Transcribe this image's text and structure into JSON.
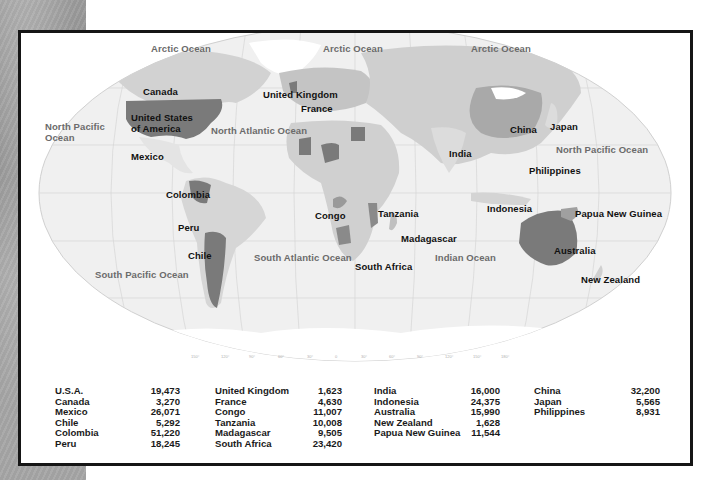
{
  "map": {
    "oceans": [
      {
        "label": "Arctic Ocean",
        "x": 130,
        "y": 10
      },
      {
        "label": "Arctic Ocean",
        "x": 302,
        "y": 10
      },
      {
        "label": "Arctic Ocean",
        "x": 450,
        "y": 10
      },
      {
        "label": "North Pacific\nOcean",
        "x": 24,
        "y": 88
      },
      {
        "label": "North Atlantic Ocean",
        "x": 190,
        "y": 92
      },
      {
        "label": "North Pacific Ocean",
        "x": 535,
        "y": 111
      },
      {
        "label": "South Atlantic Ocean",
        "x": 233,
        "y": 219
      },
      {
        "label": "South Pacific Ocean",
        "x": 74,
        "y": 236
      },
      {
        "label": "Indian Ocean",
        "x": 414,
        "y": 219
      }
    ],
    "countries": [
      {
        "label": "Canada",
        "x": 122,
        "y": 53
      },
      {
        "label": "United States\nof America",
        "x": 110,
        "y": 79
      },
      {
        "label": "Mexico",
        "x": 110,
        "y": 118
      },
      {
        "label": "Colombia",
        "x": 145,
        "y": 156
      },
      {
        "label": "Peru",
        "x": 157,
        "y": 189
      },
      {
        "label": "Chile",
        "x": 167,
        "y": 217
      },
      {
        "label": "United Kingdom",
        "x": 242,
        "y": 56
      },
      {
        "label": "France",
        "x": 280,
        "y": 70
      },
      {
        "label": "Congo",
        "x": 294,
        "y": 177
      },
      {
        "label": "Tanzania",
        "x": 357,
        "y": 175
      },
      {
        "label": "Madagascar",
        "x": 380,
        "y": 200
      },
      {
        "label": "South Africa",
        "x": 334,
        "y": 228
      },
      {
        "label": "China",
        "x": 489,
        "y": 91
      },
      {
        "label": "India",
        "x": 428,
        "y": 115
      },
      {
        "label": "Japan",
        "x": 529,
        "y": 88
      },
      {
        "label": "Philippines",
        "x": 508,
        "y": 132
      },
      {
        "label": "Indonesia",
        "x": 466,
        "y": 170
      },
      {
        "label": "Papua New Guinea",
        "x": 554,
        "y": 175
      },
      {
        "label": "Australia",
        "x": 533,
        "y": 212
      },
      {
        "label": "New Zealand",
        "x": 560,
        "y": 241
      }
    ],
    "longitude_ticks": [
      "150°",
      "120°",
      "90°",
      "60°",
      "30°",
      "0",
      "30°",
      "60°",
      "90°",
      "120°",
      "150°",
      "180°"
    ]
  },
  "table": {
    "columns": [
      {
        "rows": [
          {
            "name": "U.S.A.",
            "value": "19,473"
          },
          {
            "name": "Canada",
            "value": "3,270"
          },
          {
            "name": "Mexico",
            "value": "26,071"
          },
          {
            "name": "Chile",
            "value": "5,292"
          },
          {
            "name": "Colombia",
            "value": "51,220"
          },
          {
            "name": "Peru",
            "value": "18,245"
          }
        ]
      },
      {
        "rows": [
          {
            "name": "United Kingdom",
            "value": "1,623"
          },
          {
            "name": "France",
            "value": "4,630"
          },
          {
            "name": "Congo",
            "value": "11,007"
          },
          {
            "name": "Tanzania",
            "value": "10,008"
          },
          {
            "name": "Madagascar",
            "value": "9,505"
          },
          {
            "name": "South Africa",
            "value": "23,420"
          }
        ]
      },
      {
        "rows": [
          {
            "name": "India",
            "value": "16,000"
          },
          {
            "name": "Indonesia",
            "value": "24,375"
          },
          {
            "name": "Australia",
            "value": "15,990"
          },
          {
            "name": "New Zealand",
            "value": "1,628"
          },
          {
            "name": "Papua New Guinea",
            "value": "11,544"
          }
        ]
      },
      {
        "rows": [
          {
            "name": "China",
            "value": "32,200"
          },
          {
            "name": "Japan",
            "value": "5,565"
          },
          {
            "name": "Philippines",
            "value": "8,931"
          }
        ]
      }
    ]
  },
  "colors": {
    "ocean": "#f1f1f1",
    "land_light": "#d9d9d9",
    "land_mid": "#b8b8b8",
    "land_dark": "#7a7a7a",
    "ice": "#ffffff",
    "border": "#151515"
  }
}
